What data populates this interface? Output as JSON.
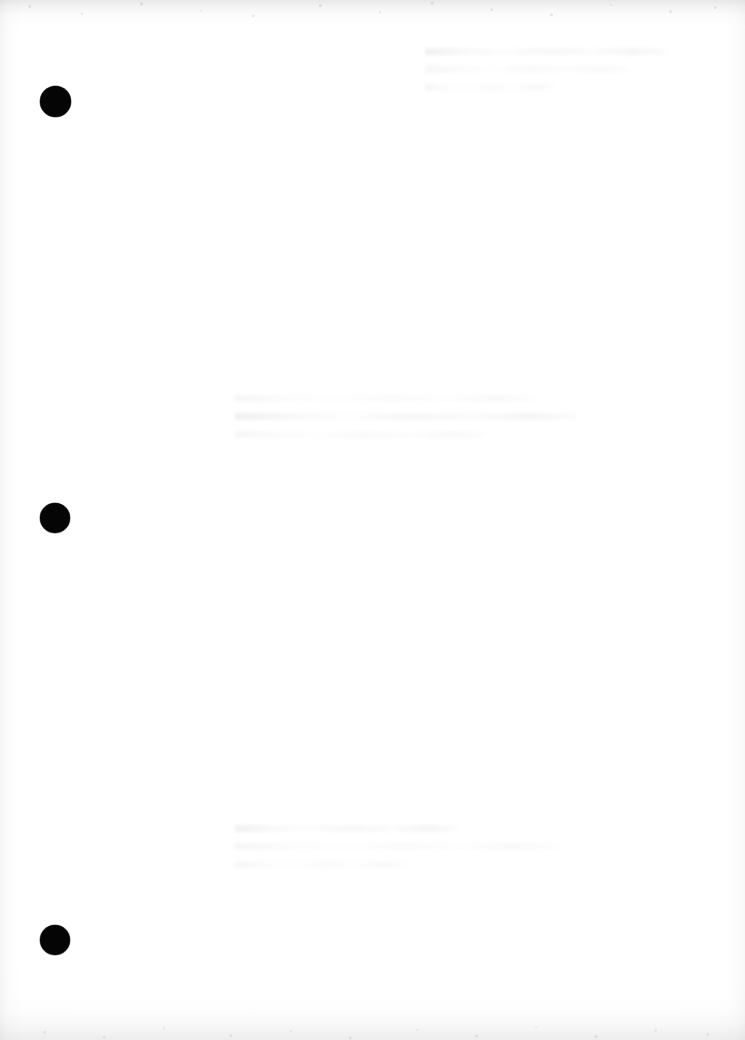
{
  "page": {
    "label": "Scanned document page",
    "width": 745,
    "height": 1040,
    "background_color": "#ffffff",
    "paper_tone": "#fdfdfd",
    "content_note": "Blank scanned page",
    "orientation": "portrait"
  },
  "marks": {
    "label": "Punch hole marks",
    "ink_color": "#050505",
    "count": 3,
    "dots": [
      {
        "name": "punch-hole-top",
        "center_x": 55,
        "center_y": 101,
        "diameter": 31,
        "color": "#050505"
      },
      {
        "name": "punch-hole-middle",
        "center_x": 55,
        "center_y": 518,
        "diameter": 30,
        "color": "#050505"
      },
      {
        "name": "punch-hole-bottom",
        "center_x": 55,
        "center_y": 940,
        "diameter": 30,
        "color": "#050505"
      }
    ]
  },
  "scan_artifacts": {
    "label": "Scan edge noise",
    "edge_shadow_color": "#8c8c8e",
    "top_band_height": 26,
    "bottom_band_height": 44,
    "left_band_width": 20,
    "right_band_width": 22
  },
  "bleed_through": {
    "label": "Reverse-side show-through",
    "ink_color": "#b0b0b6",
    "blocks": [
      {
        "name": "ghost-text-upper",
        "x": 425,
        "y": 48,
        "width": 270,
        "lines": 3
      },
      {
        "name": "ghost-text-middle",
        "x": 235,
        "y": 395,
        "width": 360,
        "lines": 3
      },
      {
        "name": "ghost-text-lower",
        "x": 235,
        "y": 825,
        "width": 360,
        "lines": 3
      }
    ]
  }
}
